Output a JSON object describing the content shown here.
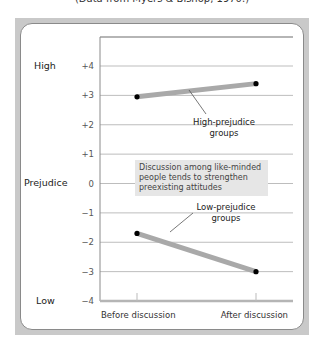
{
  "caption": "(Data from Myers & Bishop, 1970.)",
  "chart_data": {
    "type": "line",
    "title": "",
    "xlabel": "",
    "ylabel": "Prejudice",
    "categories": [
      "Before discussion",
      "After discussion"
    ],
    "ylim": [
      -4,
      4
    ],
    "yticks": [
      "+4",
      "+3",
      "+2",
      "+1",
      "0",
      "−1",
      "−2",
      "−3",
      "−4"
    ],
    "ytick_values": [
      4,
      3,
      2,
      1,
      0,
      -1,
      -2,
      -3,
      -4
    ],
    "y_extreme_labels": {
      "high": "High",
      "low": "Low"
    },
    "grid": true,
    "series": [
      {
        "name": "High-prejudice groups",
        "values": [
          2.95,
          3.4
        ],
        "label_line1": "High-prejudice",
        "label_line2": "groups"
      },
      {
        "name": "Low-prejudice groups",
        "values": [
          -1.7,
          -3.0
        ],
        "label_line1": "Low-prejudice",
        "label_line2": "groups"
      }
    ],
    "annotation": "Discussion among like-minded people tends to strengthen preexisting attitudes",
    "colors": {
      "line": "#a9a9a9",
      "point": "#000000",
      "grid": "#bdbdbd",
      "annotation_bg": "#e6e6e6"
    }
  }
}
